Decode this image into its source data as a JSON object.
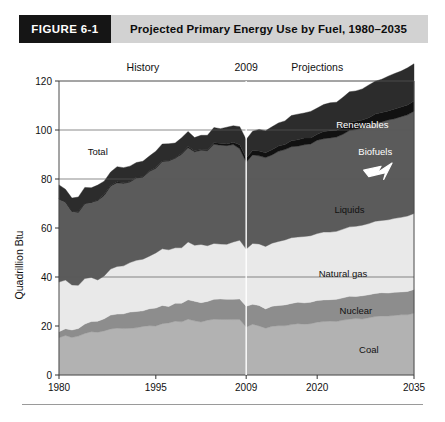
{
  "header": {
    "figure_number": "FIGURE 6-1",
    "title": "Projected Primary Energy Use by Fuel, 1980–2035",
    "number_bg": "#151515",
    "band_bg": "#d2d2d2"
  },
  "chart_data": {
    "type": "area",
    "stacked": true,
    "title": "Projected Primary Energy Use by Fuel, 1980–2035",
    "xlabel": "",
    "ylabel": "Quadrillion Btu",
    "xlim": [
      1980,
      2035
    ],
    "ylim": [
      0,
      120
    ],
    "yticks": [
      0,
      20,
      40,
      60,
      80,
      100,
      120
    ],
    "xticks": [
      1980,
      1995,
      2009,
      2020,
      2035
    ],
    "xtick_labels": [
      "1980",
      "1995",
      "2009",
      "2020",
      "2035"
    ],
    "ytick_labels": [
      "0",
      "20",
      "40",
      "60",
      "80",
      "100",
      "120"
    ],
    "grid": "horizontal-gridlines-at-100-and-80-and-40",
    "gridlines": [
      40,
      80,
      100
    ],
    "legend": "inline-band-labels",
    "divider_year": 2009,
    "divider_label": "2009",
    "annotations": [
      {
        "name": "history-label",
        "text": "History",
        "x": 1993,
        "y": 126
      },
      {
        "name": "divider-year-label",
        "text": "2009",
        "x": 2009,
        "y": 126
      },
      {
        "name": "projections-label",
        "text": "Projections",
        "x": 2020,
        "y": 126
      },
      {
        "name": "total-label",
        "text": "Total",
        "x": 1986,
        "y": 90
      },
      {
        "name": "renewables-label",
        "text": "Renewables",
        "x": 2027,
        "y": 101
      },
      {
        "name": "biofuels-label",
        "text": "Biofuels",
        "x": 2029,
        "y": 90
      },
      {
        "name": "liquids-label",
        "text": "Liquids",
        "x": 2025,
        "y": 66
      },
      {
        "name": "natural-gas-label",
        "text": "Natural gas",
        "x": 2024,
        "y": 40
      },
      {
        "name": "nuclear-label",
        "text": "Nuclear",
        "x": 2026,
        "y": 25
      },
      {
        "name": "coal-label",
        "text": "Coal",
        "x": 2028,
        "y": 9
      }
    ],
    "biofuels_arrow": {
      "name": "biofuels-arrow",
      "color": "#ffffff",
      "points_to": "biofuels-band"
    },
    "x": [
      1980,
      1981,
      1982,
      1983,
      1984,
      1985,
      1986,
      1987,
      1988,
      1989,
      1990,
      1991,
      1992,
      1993,
      1994,
      1995,
      1996,
      1997,
      1998,
      1999,
      2000,
      2001,
      2002,
      2003,
      2004,
      2005,
      2006,
      2007,
      2008,
      2009,
      2010,
      2011,
      2012,
      2013,
      2014,
      2015,
      2016,
      2017,
      2018,
      2019,
      2020,
      2021,
      2022,
      2023,
      2024,
      2025,
      2026,
      2027,
      2028,
      2029,
      2030,
      2031,
      2032,
      2033,
      2034,
      2035
    ],
    "series": [
      {
        "name": "Coal",
        "color": "#b2b2b2",
        "label_color": "#111111",
        "values": [
          15.4,
          16.0,
          15.3,
          15.9,
          17.1,
          17.5,
          17.3,
          18.0,
          18.8,
          19.1,
          19.2,
          19.0,
          19.2,
          19.9,
          19.9,
          20.1,
          21.0,
          21.4,
          21.7,
          21.6,
          22.6,
          21.9,
          21.9,
          22.3,
          22.5,
          22.8,
          22.5,
          22.8,
          22.4,
          19.7,
          20.8,
          20.0,
          19.2,
          19.9,
          20.1,
          20.3,
          20.5,
          20.7,
          20.9,
          21.1,
          21.4,
          21.6,
          21.9,
          22.1,
          22.4,
          22.6,
          22.9,
          23.1,
          23.4,
          23.6,
          23.9,
          24.1,
          24.4,
          24.6,
          24.8,
          25.0
        ]
      },
      {
        "name": "Nuclear",
        "color": "#8d8d8d",
        "label_color": "#111111",
        "values": [
          2.7,
          3.0,
          3.1,
          3.2,
          3.6,
          4.1,
          4.5,
          4.9,
          5.6,
          5.7,
          6.1,
          6.4,
          6.5,
          6.5,
          6.8,
          7.2,
          7.2,
          6.7,
          7.1,
          7.6,
          7.9,
          8.0,
          8.1,
          7.9,
          8.2,
          8.2,
          8.2,
          8.5,
          8.4,
          8.4,
          8.4,
          8.3,
          8.1,
          8.3,
          8.4,
          8.4,
          8.5,
          8.6,
          8.7,
          8.8,
          8.9,
          8.9,
          9.0,
          9.0,
          9.1,
          9.1,
          9.2,
          9.2,
          9.3,
          9.3,
          9.4,
          9.4,
          9.5,
          9.5,
          9.6,
          9.6
        ]
      },
      {
        "name": "Natural gas",
        "color": "#e9e9e9",
        "label_color": "#111111",
        "values": [
          20.4,
          19.9,
          18.5,
          17.4,
          18.5,
          17.8,
          16.7,
          17.7,
          18.6,
          19.7,
          19.7,
          20.1,
          20.8,
          21.3,
          21.7,
          22.7,
          23.1,
          23.2,
          22.8,
          22.9,
          23.8,
          22.8,
          23.6,
          22.9,
          23.0,
          22.6,
          22.2,
          23.6,
          23.8,
          23.4,
          24.7,
          24.9,
          25.5,
          25.9,
          26.2,
          26.4,
          26.6,
          26.8,
          27.0,
          27.2,
          27.4,
          27.6,
          27.8,
          28.0,
          28.2,
          28.4,
          28.7,
          28.9,
          29.1,
          29.4,
          29.6,
          29.9,
          30.1,
          30.4,
          30.6,
          30.9
        ]
      },
      {
        "name": "Liquids",
        "color": "#5b5b5b",
        "label_color": "#111111",
        "values": [
          34.2,
          31.9,
          30.2,
          30.0,
          31.0,
          30.9,
          32.2,
          32.9,
          34.2,
          34.2,
          33.6,
          32.8,
          33.5,
          33.8,
          34.7,
          34.6,
          35.8,
          36.3,
          36.8,
          37.9,
          38.3,
          38.2,
          38.2,
          38.8,
          40.3,
          40.4,
          40.0,
          39.8,
          37.3,
          35.4,
          36.3,
          36.0,
          36.0,
          36.3,
          36.6,
          36.8,
          37.0,
          37.2,
          37.4,
          37.6,
          37.9,
          38.1,
          38.4,
          38.6,
          38.9,
          39.1,
          39.4,
          39.6,
          39.9,
          40.1,
          40.4,
          40.6,
          40.9,
          41.2,
          41.4,
          41.7
        ]
      },
      {
        "name": "Biofuels",
        "color": "#111111",
        "label_color": "#ffffff",
        "values": [
          0.1,
          0.1,
          0.1,
          0.1,
          0.1,
          0.1,
          0.1,
          0.1,
          0.1,
          0.1,
          0.1,
          0.1,
          0.1,
          0.1,
          0.2,
          0.2,
          0.2,
          0.2,
          0.2,
          0.2,
          0.2,
          0.2,
          0.3,
          0.4,
          0.5,
          0.6,
          0.8,
          1.1,
          1.4,
          1.5,
          1.7,
          1.8,
          1.9,
          2.0,
          2.1,
          2.2,
          2.3,
          2.4,
          2.5,
          2.6,
          2.7,
          2.8,
          2.9,
          3.0,
          3.1,
          3.2,
          3.3,
          3.4,
          3.5,
          3.6,
          3.7,
          3.8,
          3.9,
          4.0,
          4.1,
          4.2
        ]
      },
      {
        "name": "Renewables",
        "color": "#2c2c2c",
        "label_color": "#ffffff",
        "values": [
          5.5,
          4.9,
          5.6,
          6.3,
          6.3,
          6.1,
          6.2,
          5.7,
          5.4,
          6.2,
          6.0,
          6.1,
          5.9,
          6.1,
          6.1,
          6.5,
          7.0,
          6.6,
          6.0,
          6.1,
          6.1,
          5.3,
          5.8,
          6.0,
          6.1,
          6.2,
          6.6,
          6.6,
          7.2,
          7.6,
          8.0,
          8.7,
          9.0,
          9.4,
          9.6,
          9.8,
          10.0,
          10.2,
          10.4,
          10.6,
          10.8,
          11.1,
          11.3,
          11.6,
          11.9,
          12.2,
          12.5,
          12.8,
          13.1,
          13.4,
          13.7,
          14.0,
          14.3,
          14.6,
          14.9,
          15.2
        ]
      }
    ]
  }
}
